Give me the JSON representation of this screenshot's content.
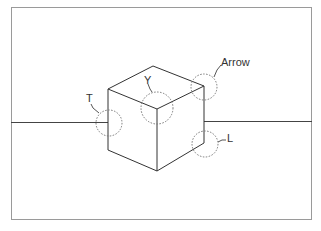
{
  "figure": {
    "type": "line-drawing junction labeling",
    "labels": {
      "t": "T",
      "y": "Y",
      "arrow": "Arrow",
      "l": "L"
    },
    "colors": {
      "line": "#333333",
      "frame": "#999999",
      "circle": "#777777",
      "background": "#ffffff"
    }
  }
}
